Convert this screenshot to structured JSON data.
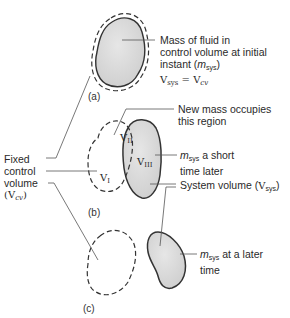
{
  "figure": {
    "panels": [
      {
        "id": "a",
        "caption": "(a)"
      },
      {
        "id": "b",
        "caption": "(b)"
      },
      {
        "id": "c",
        "caption": "(c)"
      }
    ],
    "labels": {
      "a_line1": "Mass of fluid in",
      "a_line2": "control volume at initial",
      "a_line3_pre": "instant (",
      "a_line3_m": "m",
      "a_line3_sub": "sys",
      "a_line3_post": ")",
      "a_eq_v1": "V",
      "a_eq_sub1": "sys",
      "a_eq_mid": " = ",
      "a_eq_v2": "V",
      "a_eq_sub2": "cv",
      "fixed_line1": "Fixed",
      "fixed_line2": "control",
      "fixed_line3": "volume",
      "fixed_line4_pre": "(",
      "fixed_line4_v": "V",
      "fixed_line4_sub": "cv",
      "fixed_line4_post": ")",
      "new_mass_line1": "New mass occupies",
      "new_mass_line2": "this region",
      "short_m": "m",
      "short_sub": "sys",
      "short_line1_post": " a short",
      "short_line2": "time later",
      "sysvol_pre": "System volume (",
      "sysvol_v": "V",
      "sysvol_sub": "sys",
      "sysvol_post": ")",
      "later_m": "m",
      "later_sub": "sys",
      "later_line1_post": " at a later",
      "later_line2": "time"
    },
    "region_labels": {
      "I": {
        "v": "V",
        "sub": "I"
      },
      "II": {
        "v": "V",
        "sub": "II"
      },
      "III": {
        "v": "V",
        "sub": "III"
      }
    },
    "colors": {
      "fill": "#d9d9d9",
      "stroke": "#333333",
      "leader": "#555555"
    }
  }
}
